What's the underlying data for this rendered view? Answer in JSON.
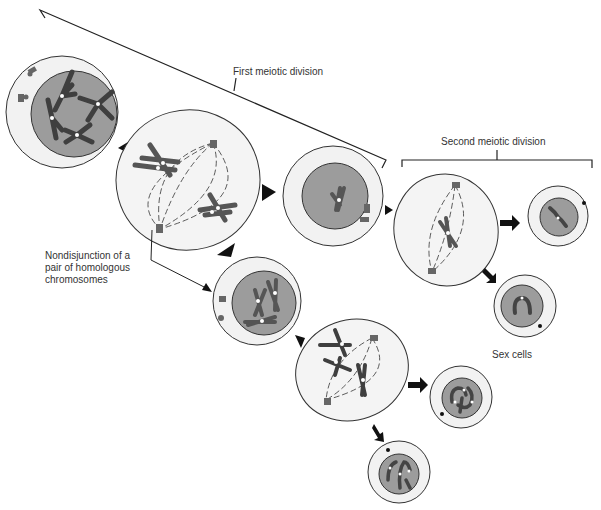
{
  "labels": {
    "first_division": "First meiotic division",
    "second_division": "Second meiotic division",
    "nondisjunction": "Nondisjunction of a\npair of homologous\nchromosomes",
    "sex_cells": "Sex cells"
  },
  "colors": {
    "outline": "#333333",
    "cytoplasm": "#f2f2f2",
    "nucleus": "#9c9c9c",
    "chromosome_dark": "#4a4a4a",
    "chromosome_mid": "#6e6e6e",
    "arrow": "#111111"
  },
  "cells": [
    {
      "id": "parent-cell",
      "stage": "prophase I"
    },
    {
      "id": "metaphase-i-cell",
      "stage": "metaphase I with nondisjunction"
    },
    {
      "id": "daughter-cell-a",
      "stage": "after meiosis I, 1 chromosome"
    },
    {
      "id": "daughter-cell-b",
      "stage": "after meiosis I, 3 chromosomes"
    },
    {
      "id": "metaphase-ii-cell-a",
      "stage": "metaphase II"
    },
    {
      "id": "metaphase-ii-cell-b",
      "stage": "metaphase II"
    },
    {
      "id": "gamete-1",
      "stage": "sex cell, 1 chromosome"
    },
    {
      "id": "gamete-2",
      "stage": "sex cell, 1 chromosome"
    },
    {
      "id": "gamete-3",
      "stage": "sex cell, 3 chromosomes"
    },
    {
      "id": "gamete-4",
      "stage": "sex cell, 3 chromosomes"
    }
  ]
}
